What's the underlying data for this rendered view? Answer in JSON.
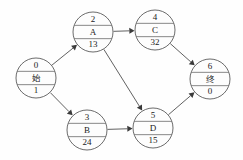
{
  "diagram": {
    "type": "aov-activity-network",
    "title": "",
    "background_color": "#fefefe",
    "line_color": "#4f4f4f",
    "text_color": "#1b1b1b",
    "node_radius": 20,
    "nodes": [
      {
        "id": "n0",
        "number": "0",
        "name": "始",
        "duration": "1",
        "cx": 36,
        "cy": 78,
        "name_is_cjk": true
      },
      {
        "id": "n2",
        "number": "2",
        "name": "A",
        "duration": "13",
        "cx": 93,
        "cy": 32,
        "name_is_cjk": false
      },
      {
        "id": "n4",
        "number": "4",
        "name": "C",
        "duration": "32",
        "cx": 155,
        "cy": 30,
        "name_is_cjk": false
      },
      {
        "id": "n3",
        "number": "3",
        "name": "B",
        "duration": "24",
        "cx": 87,
        "cy": 130,
        "name_is_cjk": false
      },
      {
        "id": "n5",
        "number": "5",
        "name": "D",
        "duration": "15",
        "cx": 153,
        "cy": 128,
        "name_is_cjk": false
      },
      {
        "id": "n6",
        "number": "6",
        "name": "终",
        "duration": "0",
        "cx": 210,
        "cy": 79,
        "name_is_cjk": true
      }
    ],
    "edges": [
      {
        "id": "e0",
        "from": "n0",
        "to": "n2",
        "label": ""
      },
      {
        "id": "e1",
        "from": "n0",
        "to": "n3",
        "label": ""
      },
      {
        "id": "e2",
        "from": "n2",
        "to": "n4",
        "label": ""
      },
      {
        "id": "e3",
        "from": "n2",
        "to": "n5",
        "label": ""
      },
      {
        "id": "e4",
        "from": "n3",
        "to": "n5",
        "label": ""
      },
      {
        "id": "e5",
        "from": "n4",
        "to": "n6",
        "label": ""
      },
      {
        "id": "e6",
        "from": "n5",
        "to": "n6",
        "label": ""
      }
    ]
  }
}
